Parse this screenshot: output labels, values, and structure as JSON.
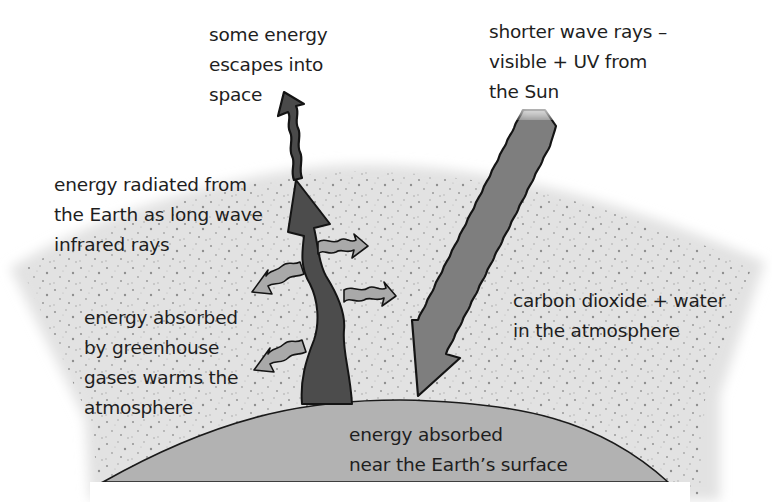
{
  "diagram": {
    "topic": "greenhouse effect",
    "colors": {
      "background": "#ffffff",
      "atmosphere": "#e4e4e4",
      "atmosphere_speckle": "#8a8a8a",
      "earth": "#b2b2b2",
      "outgoing_arrow": "#4e4e4e",
      "incoming_arrow": "#7e7e7e",
      "reemitted_arrows": "#a8a8a8",
      "outline": "#1a1a1a"
    },
    "labels": {
      "escape": "some energy\nescapes into\nspace",
      "sun_rays": "shorter wave rays –\nvisible + UV from\nthe Sun",
      "radiated": "energy radiated from\nthe Earth as long wave\ninfrared rays",
      "absorbed_gases": "energy absorbed\nby greenhouse\ngases warms the\natmosphere",
      "gases": "carbon dioxide + water\nin the atmosphere",
      "surface": "energy absorbed\nnear the Earth’s surface"
    },
    "elements": {
      "earth": "Earth surface",
      "atmosphere": "atmosphere layer",
      "incoming": "short wave rays from Sun",
      "outgoing": "long wave infrared rays",
      "escaping": "energy escaping to space",
      "reemitted": "energy absorbed and re-emitted by greenhouse gases"
    }
  }
}
